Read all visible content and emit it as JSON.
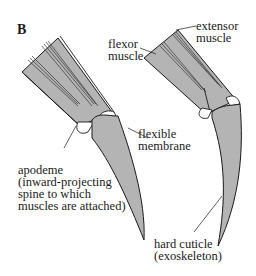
{
  "panel_label": "B",
  "labels": {
    "flexor": [
      "flexor",
      "muscle"
    ],
    "extensor": [
      "extensor",
      "muscle"
    ],
    "membrane": [
      "flexible",
      "membrane"
    ],
    "apodeme": [
      "apodeme",
      "(inward-projecting",
      "spine to which",
      "muscles are attached)"
    ],
    "cuticle": [
      "hard cuticle",
      "(exoskeleton)"
    ]
  },
  "colors": {
    "segment_fill": "#b4b4b4",
    "outline": "#1a1a1a",
    "membrane_fill": "#ffffff"
  }
}
